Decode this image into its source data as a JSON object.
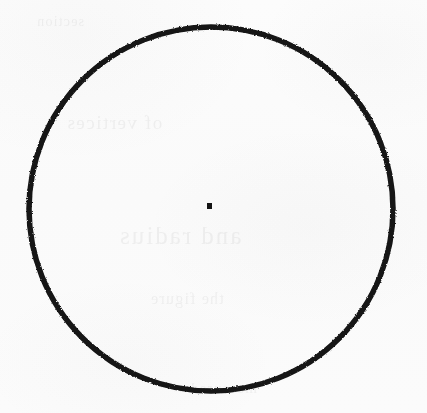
{
  "document": {
    "kind": "scanned-geometry-figure",
    "width": 427,
    "height": 413,
    "background_color": "#fbfbfb",
    "ink_color": "#141414"
  },
  "figure": {
    "name": "circle-with-center-point",
    "caption": "",
    "shapes": [
      {
        "id": "circle-outline",
        "type": "circle",
        "cx": 211,
        "cy": 209,
        "r": 182,
        "stroke_color": "#141414",
        "stroke_width": 5.5,
        "fill": "none",
        "style": "hand-drawn"
      },
      {
        "id": "center-point",
        "type": "square-dot",
        "x": 207,
        "y": 203,
        "width": 5,
        "height": 6,
        "fill_color": "#141414"
      }
    ],
    "labels": []
  },
  "ghost": {
    "note": "illegible bleed-through text from the reverse side of the page",
    "lines": [
      "of vertices",
      "and radius",
      "the figure",
      "measured",
      "section"
    ]
  }
}
